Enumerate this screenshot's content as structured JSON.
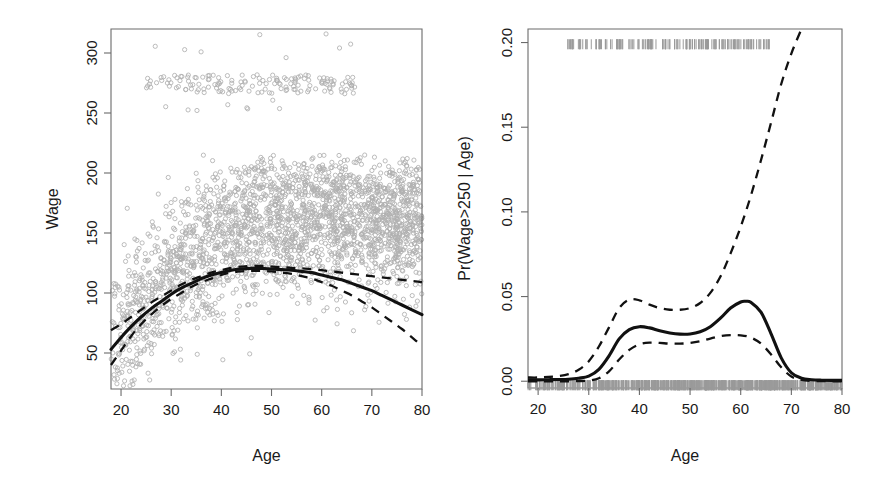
{
  "figure": {
    "title": "",
    "background": "#ffffff",
    "panel_count": 2
  },
  "colors": {
    "point": "#b0b0b0",
    "fit": "#111111",
    "ci": "#111111",
    "axis": "#6b6b6b",
    "rug": "#9a9a9a",
    "text": "#1a1a1a"
  },
  "left_panel": {
    "x_axis_title": "Age",
    "y_axis_title": "Wage",
    "x_ticks": [
      "20",
      "30",
      "40",
      "50",
      "60",
      "70",
      "80"
    ],
    "y_ticks": [
      "50",
      "100",
      "150",
      "200",
      "250",
      "300"
    ]
  },
  "right_panel": {
    "x_axis_title": "Age",
    "y_axis_title": "Pr(Wage>250 | Age)",
    "x_ticks": [
      "20",
      "30",
      "40",
      "50",
      "60",
      "70",
      "80"
    ],
    "y_ticks": [
      "0.00",
      "0.05",
      "0.10",
      "0.15",
      "0.20"
    ]
  },
  "chart_data": [
    {
      "type": "scatter",
      "panel": "left",
      "title": "",
      "xlabel": "Age",
      "ylabel": "Wage",
      "xlim": [
        18,
        80
      ],
      "ylim": [
        20,
        320
      ],
      "xticks": [
        20,
        30,
        40,
        50,
        60,
        70,
        80
      ],
      "yticks": [
        50,
        100,
        150,
        200,
        250,
        300
      ],
      "grid": false,
      "legend": "none",
      "marker": "open-circle",
      "marker_color": "#b0b0b0",
      "n_points_approx": 3000,
      "series": [
        {
          "name": "Degree-4 polynomial fit",
          "style": "solid",
          "color": "#111111",
          "x": [
            18,
            20,
            22,
            24,
            26,
            28,
            30,
            32,
            34,
            36,
            38,
            40,
            42,
            44,
            46,
            48,
            50,
            52,
            54,
            56,
            58,
            60,
            62,
            64,
            66,
            68,
            70,
            72,
            74,
            76,
            78,
            80
          ],
          "y": [
            53,
            63,
            72,
            80,
            87,
            93,
            99,
            104,
            108,
            112,
            115,
            117,
            119,
            120,
            120.5,
            120.5,
            120,
            119.5,
            119,
            118,
            117,
            115,
            113,
            111,
            108,
            105,
            102,
            98,
            94,
            90,
            86,
            82
          ]
        },
        {
          "name": "Upper 95% confidence band",
          "style": "dashed",
          "color": "#111111",
          "x": [
            18,
            20,
            22,
            24,
            26,
            28,
            30,
            32,
            34,
            36,
            38,
            40,
            42,
            44,
            46,
            48,
            50,
            52,
            54,
            56,
            58,
            60,
            62,
            64,
            66,
            68,
            70,
            72,
            74,
            76,
            78,
            80
          ],
          "y": [
            69,
            74,
            80,
            86,
            92,
            97,
            102,
            107,
            111,
            114,
            117,
            119,
            121,
            122,
            122.5,
            122.5,
            122,
            121.5,
            121,
            120.5,
            120,
            119,
            118,
            117,
            116,
            115,
            114,
            113,
            112,
            111,
            110,
            109
          ]
        },
        {
          "name": "Lower 95% confidence band",
          "style": "dashed",
          "color": "#111111",
          "x": [
            18,
            20,
            22,
            24,
            26,
            28,
            30,
            32,
            34,
            36,
            38,
            40,
            42,
            44,
            46,
            48,
            50,
            52,
            54,
            56,
            58,
            60,
            62,
            64,
            66,
            68,
            70,
            72,
            74,
            76,
            78,
            80
          ],
          "y": [
            40,
            52,
            64,
            74,
            82,
            89,
            95,
            100,
            105,
            109,
            112,
            115,
            117,
            118,
            118.5,
            118.5,
            118,
            117,
            116,
            114,
            112,
            109,
            106,
            102,
            98,
            93,
            88,
            82,
            76,
            70,
            63,
            56
          ]
        }
      ]
    },
    {
      "type": "line",
      "panel": "right",
      "title": "",
      "xlabel": "Age",
      "ylabel": "Pr(Wage>250 | Age)",
      "xlim": [
        18,
        80
      ],
      "ylim": [
        -0.004,
        0.208
      ],
      "xticks": [
        20,
        30,
        40,
        50,
        60,
        70,
        80
      ],
      "yticks": [
        0.0,
        0.05,
        0.1,
        0.15,
        0.2
      ],
      "grid": false,
      "legend": "none",
      "rug_top_y": 0.199,
      "rug_bottom_y": 0.0,
      "series": [
        {
          "name": "Predicted probability",
          "style": "solid",
          "color": "#111111",
          "x": [
            18,
            20,
            22,
            24,
            26,
            28,
            30,
            32,
            34,
            36,
            38,
            40,
            42,
            44,
            46,
            48,
            50,
            52,
            54,
            56,
            58,
            60,
            61,
            62,
            64,
            66,
            68,
            70,
            72,
            74,
            76,
            78,
            80
          ],
          "y": [
            0.0008,
            0.0008,
            0.0009,
            0.001,
            0.0012,
            0.0018,
            0.003,
            0.007,
            0.015,
            0.025,
            0.0305,
            0.0322,
            0.0315,
            0.0298,
            0.0285,
            0.0278,
            0.0279,
            0.0292,
            0.0322,
            0.0372,
            0.0432,
            0.0468,
            0.0472,
            0.0466,
            0.0408,
            0.028,
            0.0138,
            0.005,
            0.0018,
            0.0009,
            0.0006,
            0.0005,
            0.0005
          ]
        },
        {
          "name": "Upper 95% confidence band",
          "style": "dashed",
          "color": "#111111",
          "x": [
            18,
            20,
            22,
            24,
            26,
            28,
            30,
            32,
            34,
            36,
            38,
            40,
            42,
            44,
            46,
            48,
            50,
            52,
            54,
            56,
            58,
            60,
            62,
            64,
            66,
            68,
            70,
            72
          ],
          "y": [
            0.0022,
            0.0022,
            0.0025,
            0.003,
            0.0042,
            0.0068,
            0.0118,
            0.0205,
            0.0318,
            0.0432,
            0.0482,
            0.0478,
            0.0452,
            0.0432,
            0.0422,
            0.0422,
            0.0432,
            0.0462,
            0.0522,
            0.0618,
            0.0755,
            0.0912,
            0.1095,
            0.1305,
            0.1528,
            0.1755,
            0.1935,
            0.208
          ]
        },
        {
          "name": "Lower 95% confidence band",
          "style": "dashed",
          "color": "#111111",
          "x": [
            18,
            20,
            22,
            24,
            26,
            28,
            30,
            32,
            34,
            36,
            38,
            40,
            42,
            44,
            46,
            48,
            50,
            52,
            54,
            56,
            58,
            60,
            62,
            64,
            66,
            68,
            70,
            72,
            74,
            76,
            78,
            80
          ],
          "y": [
            0.0,
            0.0,
            0.0,
            0.0,
            0.0,
            0.0001,
            0.0004,
            0.0018,
            0.0058,
            0.0128,
            0.0185,
            0.0218,
            0.0228,
            0.0226,
            0.0222,
            0.0222,
            0.0226,
            0.0236,
            0.0252,
            0.0266,
            0.0272,
            0.0271,
            0.0258,
            0.0222,
            0.0158,
            0.0082,
            0.0028,
            0.0008,
            0.0002,
            0.0001,
            0.0,
            0.0
          ]
        }
      ]
    }
  ]
}
